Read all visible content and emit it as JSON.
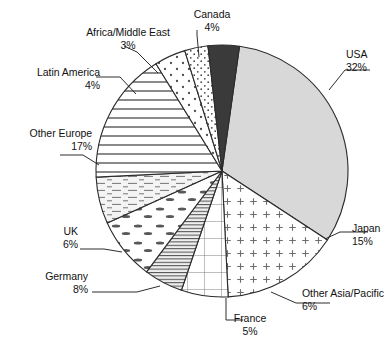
{
  "chart_data": {
    "type": "pie",
    "title": "",
    "subtitle": "",
    "xlabel": "",
    "ylabel": "",
    "legend_position": "none",
    "grid": false,
    "units": "percent",
    "total": 100,
    "categories": [
      "USA",
      "Japan",
      "Other Asia/Pacific",
      "France",
      "Germany",
      "UK",
      "Other Europe",
      "Latin America",
      "Africa/Middle East",
      "Canada"
    ],
    "values": [
      32,
      15,
      6,
      5,
      8,
      6,
      17,
      4,
      3,
      4
    ],
    "slices": [
      {
        "label": "USA",
        "percent": "32%",
        "value": 32,
        "fill": "solid-light-gray",
        "color": "#d8d8d8",
        "label_align": "left",
        "label_x": 346,
        "label_y": 48,
        "leader": [
          [
            329,
            90
          ],
          [
            345,
            70
          ],
          [
            370,
            70
          ]
        ]
      },
      {
        "label": "Japan",
        "percent": "15%",
        "value": 15,
        "fill": "plus-dots",
        "color": "#ffffff",
        "label_align": "left",
        "label_x": 352,
        "label_y": 222,
        "leader": [
          [
            325,
            239
          ],
          [
            340,
            232
          ],
          [
            368,
            232
          ]
        ]
      },
      {
        "label": "Other Asia/Pacific",
        "percent": "6%",
        "value": 6,
        "fill": "grid",
        "color": "#ffffff",
        "label_align": "left",
        "label_x": 302,
        "label_y": 287,
        "leader": [
          [
            271,
            292
          ],
          [
            296,
            303
          ],
          [
            330,
            303
          ]
        ]
      },
      {
        "label": "France",
        "percent": "5%",
        "value": 5,
        "fill": "dense-horizontal",
        "color": "#e8e8e8",
        "label_align": "center",
        "label_x": 250,
        "label_y": 312,
        "leader": [
          [
            226,
            298
          ],
          [
            226,
            320
          ],
          [
            243,
            320
          ]
        ]
      },
      {
        "label": "Germany",
        "percent": "8%",
        "value": 8,
        "fill": "dash-ellipse",
        "color": "#ffffff",
        "label_align": "right",
        "label_x": 88,
        "label_y": 270,
        "leader": [
          [
            160,
            286
          ],
          [
            137,
            292
          ],
          [
            92,
            292
          ]
        ]
      },
      {
        "label": "UK",
        "percent": "6%",
        "value": 6,
        "fill": "fine-dash-horizontal",
        "color": "#f2f2f2",
        "label_align": "right",
        "label_x": 78,
        "label_y": 225,
        "leader": [
          [
            122,
            252
          ],
          [
            104,
            249
          ],
          [
            80,
            249
          ]
        ]
      },
      {
        "label": "Other Europe",
        "percent": "17%",
        "value": 17,
        "fill": "horizontal-lines",
        "color": "#ffffff",
        "label_align": "right",
        "label_x": 92,
        "label_y": 127,
        "leader": [
          [
            99,
            165
          ],
          [
            83,
            155
          ],
          [
            60,
            155
          ]
        ]
      },
      {
        "label": "Latin America",
        "percent": "4%",
        "value": 4,
        "fill": "sparse-dots",
        "color": "#ffffff",
        "label_align": "right",
        "label_x": 100,
        "label_y": 66,
        "leader": [
          [
            136,
            94
          ],
          [
            120,
            77
          ],
          [
            96,
            77
          ]
        ]
      },
      {
        "label": "Africa/Middle East",
        "percent": "3%",
        "value": 3,
        "fill": "fine-dots",
        "color": "#ffffff",
        "label_align": "center",
        "label_x": 128,
        "label_y": 26,
        "leader": [
          [
            158,
            73
          ],
          [
            137,
            52
          ],
          [
            124,
            46
          ]
        ]
      },
      {
        "label": "Canada",
        "percent": "4%",
        "value": 4,
        "fill": "dark-solid",
        "color": "#3a3a3a",
        "label_align": "center",
        "label_x": 212,
        "label_y": 8,
        "leader": [
          [
            199,
            57
          ],
          [
            197,
            35
          ],
          [
            197,
            30
          ]
        ]
      }
    ],
    "geometry": {
      "center_x": 222,
      "center_y": 171,
      "radius": 126,
      "start_angle_deg": 8
    }
  }
}
